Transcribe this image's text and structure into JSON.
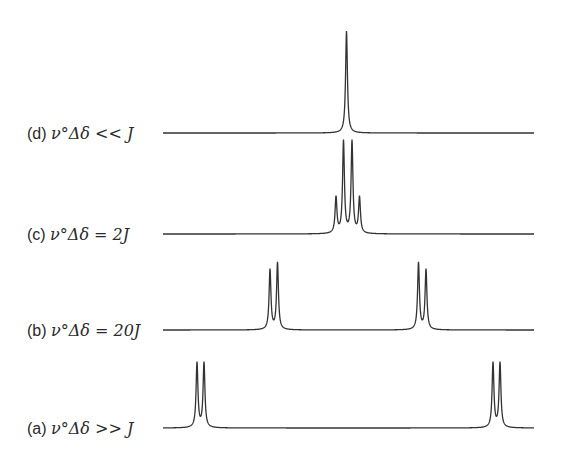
{
  "figure": {
    "line_color": "#333333",
    "text_color": "#2a2a2a",
    "spectra": [
      {
        "id": "d",
        "label_prefix": "(d)",
        "label_expr": "ν°Δδ << J",
        "condition": "ν°Δδ << J",
        "baseline_y": 133,
        "label_y": 125,
        "peaks": [
          {
            "x": 346.5,
            "height": 102
          }
        ]
      },
      {
        "id": "c",
        "label_prefix": "(c)",
        "label_expr": "ν°Δδ = 2J",
        "condition": "ν°Δδ = 2J",
        "baseline_y": 234,
        "label_y": 226,
        "peaks": [
          {
            "x": 336,
            "height": 36
          },
          {
            "x": 343.5,
            "height": 92
          },
          {
            "x": 352,
            "height": 92
          },
          {
            "x": 359.5,
            "height": 36
          }
        ]
      },
      {
        "id": "b",
        "label_prefix": "(b)",
        "label_expr": "ν°Δδ = 20J",
        "condition": "ν°Δδ = 20J",
        "baseline_y": 330,
        "label_y": 322,
        "peaks": [
          {
            "x": 270,
            "height": 60
          },
          {
            "x": 277.5,
            "height": 67
          },
          {
            "x": 418.5,
            "height": 67
          },
          {
            "x": 426,
            "height": 60
          }
        ]
      },
      {
        "id": "a",
        "label_prefix": "(a)",
        "label_expr": "ν°Δδ >> J",
        "condition": "ν°Δδ >> J",
        "baseline_y": 428,
        "label_y": 420,
        "peaks": [
          {
            "x": 197,
            "height": 65
          },
          {
            "x": 204,
            "height": 65
          },
          {
            "x": 493,
            "height": 65
          },
          {
            "x": 500,
            "height": 65
          }
        ]
      }
    ],
    "baseline_x_start": 163,
    "baseline_x_end": 534
  }
}
